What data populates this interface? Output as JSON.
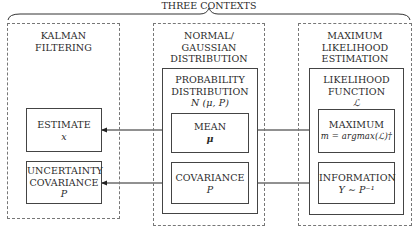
{
  "title": "THREE CONTEXTS",
  "contexts": [
    {
      "header_line1": "KALMAN",
      "header_line2": "FILTERING",
      "boxes": [
        {
          "line1": "ESTIMATE",
          "math": "x"
        },
        {
          "line1": "UNCERTAINTY",
          "line2": "COVARIANCE",
          "math": "P"
        }
      ]
    },
    {
      "header_line1": "NORMAL/",
      "header_line2": "GAUSSIAN",
      "header_line3": "DISTRIBUTION",
      "group": {
        "line1": "PROBABILITY",
        "line2": "DISTRIBUTION",
        "math": "N (μ, P)"
      },
      "boxes": [
        {
          "line1": "MEAN",
          "math": "μ"
        },
        {
          "line1": "COVARIANCE",
          "math": "P"
        }
      ]
    },
    {
      "header_line1": "MAXIMUM",
      "header_line2": "LIKELIHOOD",
      "header_line3": "ESTIMATION",
      "group": {
        "line1": "LIKELIHOOD",
        "line2": "FUNCTION",
        "math": "ℒ"
      },
      "boxes": [
        {
          "line1": "MAXIMUM",
          "math": "m = argmax(ℒ)†"
        },
        {
          "line1": "INFORMATION",
          "math": "Y ∼ P⁻¹"
        }
      ]
    }
  ],
  "connections": [
    {
      "from": "ESTIMATE",
      "to": "MEAN",
      "type": "bidirectional"
    },
    {
      "from": "MEAN",
      "to": "MAXIMUM",
      "type": "bidirectional"
    },
    {
      "from": "UNCERTAINTY COVARIANCE",
      "to": "COVARIANCE",
      "type": "bidirectional"
    },
    {
      "from": "COVARIANCE",
      "to": "INFORMATION",
      "type": "bidirectional"
    }
  ]
}
